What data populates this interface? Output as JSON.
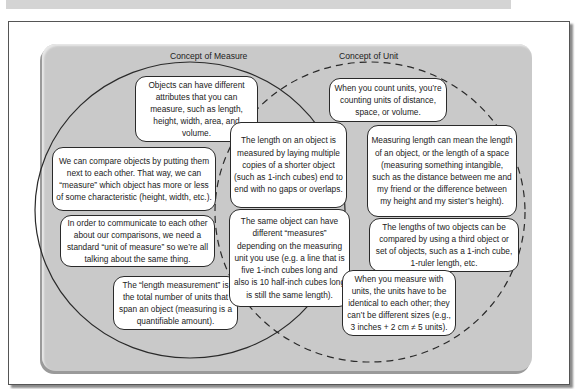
{
  "diagram": {
    "type": "venn",
    "left_set": {
      "title": "Concept of Measure",
      "line_style": "solid",
      "statements": [
        "Objects can have different attributes that you can measure, such as length, height, width, area, and volume.",
        "We can compare objects by putting them next to each other. That way, we can “measure” which object has more or less of some characteristic (height, width, etc.).",
        "In order to communicate to each other about our comparisons, we need a standard “unit of measure” so we’re all talking about the same thing.",
        "The “length measurement” is the total number of units that span an object (measuring is a quantifiable amount)."
      ]
    },
    "overlap": {
      "statements": [
        "The length on an object is measured by laying multiple copies of a shorter object (such as 1-inch cubes) end to end with no gaps or overlaps.",
        "The same object can have different “measures” depending on the measuring unit you use (e.g. a line that is five 1-inch cubes long and also is 10 half-inch cubes long is still the same length)."
      ]
    },
    "right_set": {
      "title": "Concept of Unit",
      "line_style": "dashed",
      "statements": [
        "When you count units, you’re counting units of distance, space, or volume.",
        "Measuring length can mean the length of an object, or the length of a space (measuring something intangible, such as the distance between me and my friend or the difference between my height and my sister’s height).",
        "The lengths of two objects can be compared by using a third object or set of objects, such as a 1-inch cube, 1-ruler length, etc.",
        "When you measure with units, the units have to be identical to each other; they can’t be different sizes (e.g., 3 inches + 2 cm ≠ 5 units)."
      ]
    },
    "colors": {
      "panel": "#c9c9c9",
      "bubble_fill": "#ffffff",
      "outline": "#2a2a2a"
    }
  }
}
